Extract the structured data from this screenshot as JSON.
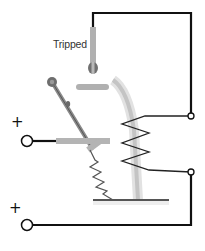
{
  "diagram": {
    "labels": {
      "tripped": "Tripped",
      "terminal_top_sign": "+",
      "terminal_bottom_sign": "+"
    },
    "components": [
      "input-terminal-top",
      "input-terminal-bottom",
      "switch-lever",
      "fixed-contact",
      "moving-contact-bar",
      "tripped-contact-post",
      "bimetal-strip",
      "heater-coil",
      "return-spring",
      "base-plate",
      "wire-top-loop",
      "wire-bottom-loop",
      "connection-terminal-upper",
      "connection-terminal-lower"
    ],
    "colors": {
      "wire": "#111111",
      "mechanism_gray": "#a8a8a8",
      "dark_gray": "#666666",
      "bimetal_light": "#d8d8d8",
      "coil": "#222222",
      "background": "#ffffff"
    }
  }
}
